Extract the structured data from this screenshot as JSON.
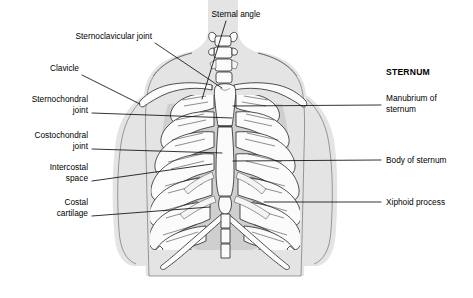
{
  "figure": {
    "background_color": "#ffffff",
    "skin_color": "#e4e4e4",
    "bone_color": "#fbfbfb",
    "outline_color": "#1a1a1a",
    "cavity_color": "#d2d2d2"
  },
  "headings": [
    {
      "id": "sternum-heading",
      "text": "STERNUM",
      "x": 386,
      "y": 75,
      "bold": true
    }
  ],
  "labels_left": [
    {
      "id": "sternoclavicular-joint",
      "lines": [
        "Sternoclavicular joint"
      ],
      "text_x": 152,
      "text_y": 39,
      "line_height": 11
    },
    {
      "id": "clavicle",
      "lines": [
        "Clavicle"
      ],
      "text_x": 79,
      "text_y": 71,
      "line_height": 11
    },
    {
      "id": "sternochondral-joint",
      "lines": [
        "Sternochondral",
        "joint"
      ],
      "text_x": 88,
      "text_y": 102,
      "line_height": 11
    },
    {
      "id": "costochondral-joint",
      "lines": [
        "Costochondral",
        "joint"
      ],
      "text_x": 88,
      "text_y": 138,
      "line_height": 11
    },
    {
      "id": "intercostal-space",
      "lines": [
        "Intercostal",
        "space"
      ],
      "text_x": 88,
      "text_y": 170,
      "line_height": 11
    },
    {
      "id": "costal-cartilage",
      "lines": [
        "Costal",
        "cartilage"
      ],
      "text_x": 88,
      "text_y": 205,
      "line_height": 11
    }
  ],
  "labels_right": [
    {
      "id": "manubrium-of-sternum",
      "lines": [
        "Manubrium of",
        "sternum"
      ],
      "text_x": 386,
      "text_y": 101,
      "line_height": 11
    },
    {
      "id": "body-of-sternum",
      "lines": [
        "Body of sternum"
      ],
      "text_x": 386,
      "text_y": 163,
      "line_height": 11
    },
    {
      "id": "xiphoid-process",
      "lines": [
        "Xiphoid process"
      ],
      "text_x": 386,
      "text_y": 205,
      "line_height": 11
    }
  ],
  "labels_top": [
    {
      "id": "sternal-angle",
      "lines": [
        "Sternal angle"
      ],
      "text_x": 236,
      "text_y": 17,
      "line_height": 11
    }
  ],
  "leaders": [
    {
      "id": "leader-sternoclavicular-joint",
      "points": "155,43 222,88"
    },
    {
      "id": "leader-clavicle",
      "points": "82,75 140,104"
    },
    {
      "id": "leader-sternochondral-joint",
      "points": "92,113 232,118"
    },
    {
      "id": "leader-costochondral-joint",
      "points": "92,149 222,153"
    },
    {
      "id": "leader-intercostal-space",
      "points": "92,181 212,164"
    },
    {
      "id": "leader-costal-cartilage",
      "points": "92,216 210,207"
    },
    {
      "id": "leader-sternal-angle",
      "points": "226,21 202,99"
    },
    {
      "id": "leader-manubrium-of-sternum",
      "points": "381,105 233,106"
    },
    {
      "id": "leader-body-of-sternum",
      "points": "381,160 233,161"
    },
    {
      "id": "leader-xiphoid-process",
      "points": "381,202 264,202"
    }
  ],
  "anatomy_parts": [
    {
      "id": "torso-silhouette",
      "name": "torso-skin-outline"
    },
    {
      "id": "left-arm",
      "name": "left-arm-skin"
    },
    {
      "id": "right-arm",
      "name": "right-arm-skin"
    },
    {
      "id": "neck",
      "name": "neck-skin"
    },
    {
      "id": "clavicle-left",
      "name": "left-clavicle-bone"
    },
    {
      "id": "clavicle-right",
      "name": "right-clavicle-bone"
    },
    {
      "id": "vertebrae",
      "name": "cervical-vertebrae"
    },
    {
      "id": "manubrium",
      "name": "manubrium-bone"
    },
    {
      "id": "sternal-body",
      "name": "sternal-body-bone"
    },
    {
      "id": "xiphoid",
      "name": "xiphoid-bone"
    },
    {
      "id": "ribs-left",
      "name": "left-rib-set"
    },
    {
      "id": "ribs-right",
      "name": "right-rib-set"
    },
    {
      "id": "costal-margin",
      "name": "costal-margin-arch"
    }
  ]
}
